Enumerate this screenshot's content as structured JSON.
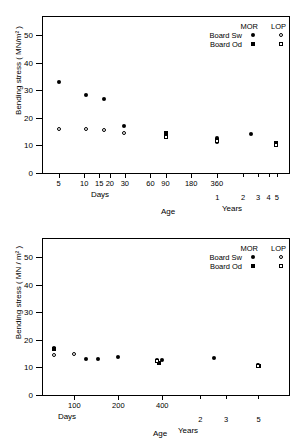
{
  "figure": {
    "panels": [
      "top",
      "bottom"
    ]
  },
  "chart_data": [
    {
      "panel": "top",
      "type": "scatter",
      "title": "",
      "xlabel": "Age",
      "ylabel": "Bending stress ( MN/m² )",
      "ylim": [
        0,
        57
      ],
      "yticks": [
        0,
        10,
        20,
        30,
        40,
        50
      ],
      "ytick_labels": [
        "0",
        "10",
        "20",
        "30",
        "40",
        "50"
      ],
      "xscale": "log",
      "xlim_days": [
        3.2,
        2600
      ],
      "xticks_days": [
        5,
        10,
        15,
        20,
        30,
        60,
        90,
        180,
        360
      ],
      "xtick_labels_days": [
        "5",
        "10",
        "15",
        "20",
        "30",
        "60",
        "90",
        "180",
        "360"
      ],
      "xticks_years": [
        1,
        2,
        3,
        4,
        5
      ],
      "xtick_labels_years": [
        "1",
        "2",
        "3",
        "4",
        "5"
      ],
      "unit_label_days": "Days",
      "unit_label_years": "Years",
      "grid": false,
      "legend": {
        "position": "top-right",
        "col_headers": [
          "MOR",
          "LOP"
        ],
        "rows": [
          {
            "label": "Board Sw",
            "mor_marker": "filled-circle",
            "lop_marker": "open-circle"
          },
          {
            "label": "Board Od",
            "mor_marker": "filled-square",
            "lop_marker": "open-square"
          }
        ]
      },
      "series": [
        {
          "name": "Board Sw MOR",
          "marker": "filled-circle",
          "points": [
            {
              "x_days": 5,
              "y": 33.2
            },
            {
              "x_days": 10.5,
              "y": 28.3
            },
            {
              "x_days": 17,
              "y": 26.7
            },
            {
              "x_days": 29,
              "y": 17.1
            },
            {
              "x_days": 90,
              "y": 14.4
            },
            {
              "x_days": 360,
              "y": 12.8
            },
            {
              "x_days": 360,
              "y": 11.4
            },
            {
              "x_days": 900,
              "y": 14.2
            },
            {
              "x_days": 1800,
              "y": 10.9
            }
          ]
        },
        {
          "name": "Board Sw LOP",
          "marker": "open-circle",
          "points": [
            {
              "x_days": 5,
              "y": 16.0
            },
            {
              "x_days": 10.5,
              "y": 16.1
            },
            {
              "x_days": 17,
              "y": 15.6
            },
            {
              "x_days": 29,
              "y": 14.4
            },
            {
              "x_days": 90,
              "y": 13.0
            },
            {
              "x_days": 360,
              "y": 12.0
            },
            {
              "x_days": 1800,
              "y": 10.4
            }
          ]
        },
        {
          "name": "Board Od MOR",
          "marker": "filled-square",
          "points": [
            {
              "x_days": 90,
              "y": 14.4
            },
            {
              "x_days": 360,
              "y": 12.1
            },
            {
              "x_days": 1800,
              "y": 10.8
            }
          ]
        },
        {
          "name": "Board Od LOP",
          "marker": "open-square",
          "points": [
            {
              "x_days": 90,
              "y": 12.9
            },
            {
              "x_days": 360,
              "y": 11.6
            },
            {
              "x_days": 1800,
              "y": 10.3
            }
          ]
        }
      ]
    },
    {
      "panel": "bottom",
      "type": "scatter",
      "title": "",
      "xlabel": "Age",
      "ylabel": "Bending stress ( MN / m² )",
      "ylim": [
        0,
        57
      ],
      "yticks": [
        0,
        10,
        20,
        30,
        40,
        50
      ],
      "ytick_labels": [
        "0",
        "10",
        "20",
        "30",
        "40",
        "50"
      ],
      "xscale": "log",
      "xlim_days": [
        60,
        3000
      ],
      "xticks_days": [
        100,
        200,
        400
      ],
      "xtick_labels_days": [
        "100",
        "200",
        "400"
      ],
      "xticks_years": [
        2,
        3,
        5
      ],
      "xtick_labels_years": [
        "2",
        "3",
        "5"
      ],
      "unit_label_days": "Days",
      "unit_label_years": "Years",
      "grid": false,
      "legend": {
        "position": "top-right",
        "col_headers": [
          "MOR",
          "LOP"
        ],
        "rows": [
          {
            "label": "Board Sw",
            "mor_marker": "filled-circle",
            "lop_marker": "open-circle"
          },
          {
            "label": "Board Od",
            "mor_marker": "filled-square",
            "lop_marker": "open-square"
          }
        ]
      },
      "series": [
        {
          "name": "Board Sw MOR",
          "marker": "filled-circle",
          "points": [
            {
              "x_days": 72,
              "y": 17.0
            },
            {
              "x_days": 120,
              "y": 13.0
            },
            {
              "x_days": 145,
              "y": 13.1
            },
            {
              "x_days": 200,
              "y": 13.8
            },
            {
              "x_days": 370,
              "y": 12.8
            },
            {
              "x_days": 400,
              "y": 12.6
            },
            {
              "x_days": 900,
              "y": 13.6
            },
            {
              "x_days": 1800,
              "y": 10.9
            }
          ]
        },
        {
          "name": "Board Sw LOP",
          "marker": "open-circle",
          "points": [
            {
              "x_days": 72,
              "y": 14.4
            },
            {
              "x_days": 100,
              "y": 14.9
            },
            {
              "x_days": 1800,
              "y": 10.8
            }
          ]
        },
        {
          "name": "Board Od MOR",
          "marker": "filled-square",
          "points": [
            {
              "x_days": 72,
              "y": 16.6
            },
            {
              "x_days": 380,
              "y": 11.5
            },
            {
              "x_days": 1850,
              "y": 10.6
            }
          ]
        },
        {
          "name": "Board Od LOP",
          "marker": "open-square",
          "points": [
            {
              "x_days": 370,
              "y": 12.2
            },
            {
              "x_days": 1800,
              "y": 10.7
            }
          ]
        }
      ]
    }
  ]
}
